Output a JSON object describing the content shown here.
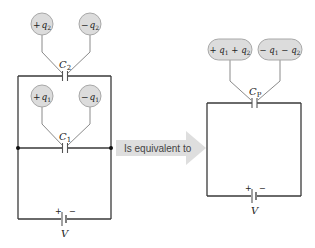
{
  "left_circuit": {
    "capacitor_top": {
      "label": "C",
      "subscript": "2",
      "charges": [
        {
          "sign": "+",
          "var": "q",
          "sub": "2"
        },
        {
          "sign": "−",
          "var": "q",
          "sub": "2"
        }
      ]
    },
    "capacitor_bottom": {
      "label": "C",
      "subscript": "1",
      "charges": [
        {
          "sign": "+",
          "var": "q",
          "sub": "1"
        },
        {
          "sign": "−",
          "var": "q",
          "sub": "1"
        }
      ]
    },
    "battery": {
      "label": "V",
      "plus": "+",
      "minus": "−"
    }
  },
  "arrow": {
    "text": "Is equivalent to"
  },
  "right_circuit": {
    "capacitor": {
      "label": "C",
      "subscript": "P",
      "charges": [
        {
          "text": "+ q",
          "sub1": "1",
          "mid": " + q",
          "sub2": "2"
        },
        {
          "text": "− q",
          "sub1": "1",
          "mid": " − q",
          "sub2": "2"
        }
      ]
    },
    "battery": {
      "label": "V",
      "plus": "+",
      "minus": "−"
    }
  },
  "colors": {
    "wire": "#3a3a3a",
    "bubble": "#dcdcdc",
    "arrow": "#dedede"
  }
}
